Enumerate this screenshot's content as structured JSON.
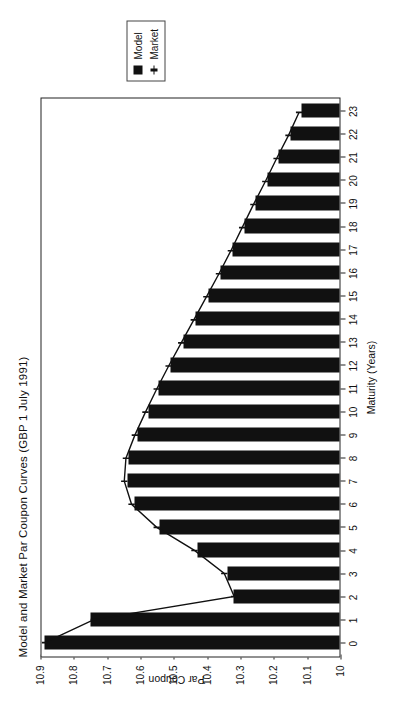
{
  "chart_data": {
    "type": "bar",
    "title": "Model and Market Par Coupon Curves (GBP 1 July 1991)",
    "xlabel": "Maturity (Years)",
    "ylabel": "Par Coupon",
    "xlim": [
      -0.6,
      23.6
    ],
    "ylim": [
      10,
      10.9
    ],
    "grid": false,
    "orientation": "vertical-bars-rendered-rotated",
    "legend_position": "outside-right",
    "x_ticks": [
      "0",
      "1",
      "2",
      "3",
      "4",
      "5",
      "6",
      "7",
      "8",
      "9",
      "10",
      "11",
      "12",
      "13",
      "14",
      "15",
      "16",
      "17",
      "18",
      "19",
      "20",
      "21",
      "22",
      "23"
    ],
    "y_ticks": [
      "10",
      "10.1",
      "10.2",
      "10.3",
      "10.4",
      "10.5",
      "10.6",
      "10.7",
      "10.8",
      "10.9"
    ],
    "categories": [
      0,
      1,
      2,
      3,
      4,
      5,
      6,
      7,
      8,
      9,
      10,
      11,
      12,
      13,
      14,
      15,
      16,
      17,
      18,
      19,
      20,
      21,
      22,
      23
    ],
    "series": [
      {
        "name": "Model",
        "marker": "filled-square",
        "values": [
          10.89,
          10.753,
          10.325,
          10.342,
          10.432,
          10.545,
          10.62,
          10.642,
          10.638,
          10.612,
          10.58,
          10.548,
          10.512,
          10.475,
          10.438,
          10.4,
          10.362,
          10.326,
          10.292,
          10.258,
          10.222,
          10.188,
          10.152,
          10.12
        ]
      },
      {
        "name": "Market",
        "marker": "line-with-ticks",
        "values": [
          10.89,
          10.742,
          10.318,
          10.348,
          10.438,
          10.552,
          10.628,
          10.65,
          10.645,
          10.618,
          10.586,
          10.552,
          10.516,
          10.478,
          10.44,
          10.402,
          10.364,
          10.328,
          10.294,
          10.26,
          10.224,
          10.19,
          10.154,
          10.122
        ]
      }
    ]
  },
  "legend": {
    "items": [
      {
        "label": "Model"
      },
      {
        "label": "Market"
      }
    ]
  },
  "colors": {
    "bar": "#111111",
    "line": "#111111",
    "frame": "#222222",
    "background": "#ffffff"
  }
}
